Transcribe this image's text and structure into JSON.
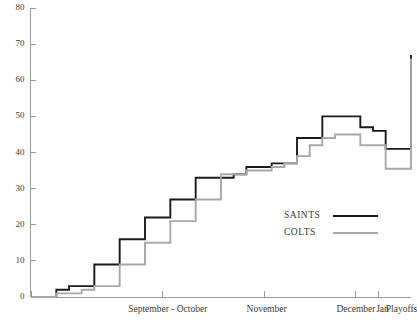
{
  "chart_data": {
    "type": "line",
    "title": "",
    "subtitle": "",
    "xlabel": "",
    "ylabel": "",
    "ylim": [
      0,
      80
    ],
    "yticks": [
      0,
      10,
      20,
      30,
      40,
      50,
      60,
      70,
      80
    ],
    "ytick_labels": [
      "0",
      "10",
      "20",
      "30",
      "40",
      "50",
      "60",
      "70",
      "80"
    ],
    "xtick_labels": [
      "September - October",
      "November",
      "December",
      "Jan",
      "Playoffs"
    ],
    "xtick_positions": [
      0.36,
      0.62,
      0.855,
      0.925,
      0.975
    ],
    "grid": false,
    "legend_position": "center-right",
    "interpolation": "step-post",
    "series": [
      {
        "name": "SAINTS",
        "color": "#1a1a1a",
        "x": [
          0,
          1,
          2,
          3,
          4,
          5,
          6,
          7,
          8,
          9,
          10,
          11,
          12,
          13,
          14,
          15,
          16,
          17,
          18,
          19,
          20,
          21,
          22,
          23,
          24,
          25,
          26,
          27,
          28,
          29,
          30
        ],
        "values": [
          0,
          0,
          2,
          3,
          3,
          9,
          9,
          16,
          16,
          22,
          22,
          27,
          27,
          33,
          33,
          33,
          34,
          36,
          36,
          37,
          37,
          44,
          44,
          50,
          50,
          50,
          47,
          46,
          41,
          41,
          67
        ]
      },
      {
        "name": "COLTS",
        "color": "#a8a8a8",
        "x": [
          0,
          1,
          2,
          3,
          4,
          5,
          6,
          7,
          8,
          9,
          10,
          11,
          12,
          13,
          14,
          15,
          16,
          17,
          18,
          19,
          20,
          21,
          22,
          23,
          24,
          25,
          26,
          27,
          28,
          29,
          30
        ],
        "values": [
          0,
          0,
          1,
          1,
          2,
          3,
          3,
          9,
          9,
          15,
          15,
          21,
          21,
          27,
          27,
          34,
          34,
          35,
          35,
          36,
          37,
          39,
          42,
          44,
          45,
          45,
          42,
          42,
          35.5,
          35.5,
          66
        ]
      }
    ]
  },
  "legend": {
    "entries": [
      {
        "label": "SAINTS",
        "color": "#1a1a1a"
      },
      {
        "label": "COLTS",
        "color": "#a8a8a8"
      }
    ]
  },
  "axes": {
    "y_max_label": "80",
    "y_min_label": "0"
  },
  "colors": {
    "saints": "#1a1a1a",
    "colts": "#a8a8a8",
    "axis": "#9a9a9a",
    "text": "#3a3a3a",
    "background": "#ffffff"
  }
}
